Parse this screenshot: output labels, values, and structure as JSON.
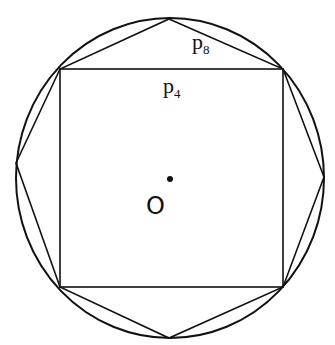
{
  "diagram": {
    "colors": {
      "stroke": "#111111",
      "background": "#ffffff"
    },
    "labels": {
      "p8": {
        "base": "p",
        "sub": "8"
      },
      "p4": {
        "base": "p",
        "sub": "4"
      },
      "center": "O"
    },
    "shapes": {
      "circle": {
        "cx": 170,
        "cy": 178,
        "rx": 154,
        "ry": 160
      },
      "square": {
        "x1": 60,
        "y1": 69,
        "x2": 283,
        "y2": 287
      },
      "octagon_vertices": [
        [
          169,
          19
        ],
        [
          283,
          69
        ],
        [
          324,
          177
        ],
        [
          283,
          287
        ],
        [
          169,
          338
        ],
        [
          60,
          287
        ],
        [
          16,
          163
        ],
        [
          60,
          69
        ]
      ],
      "center_dot": {
        "cx": 170,
        "cy": 179,
        "r": 3
      }
    }
  }
}
